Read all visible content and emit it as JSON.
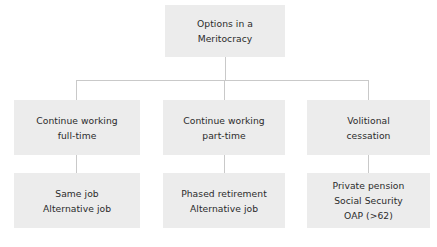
{
  "diagram": {
    "title": "Options in a Meritocracy",
    "orientation": "top-down-tree",
    "levels": 3,
    "colors": {
      "node_fill": "#ececec",
      "node_text": "#2b2b2b",
      "connector": "#c9c9c9",
      "background": "#ffffff"
    },
    "root": {
      "label_line_1": "Options in a",
      "label_line_2": "Meritocracy"
    },
    "branches": [
      {
        "id": "continue-working-full-time",
        "option_line_1": "Continue working",
        "option_line_2": "full-time",
        "detail_lines": [
          "Same job",
          "Alternative job"
        ]
      },
      {
        "id": "continue-working-part-time",
        "option_line_1": "Continue working",
        "option_line_2": "part-time",
        "detail_lines": [
          "Phased retirement",
          "Alternative job"
        ]
      },
      {
        "id": "volitional-cessation",
        "option_line_1": "Volitional",
        "option_line_2": "cessation",
        "detail_lines": [
          "Private pension",
          "Social Security",
          "OAP (>62)"
        ]
      }
    ]
  }
}
